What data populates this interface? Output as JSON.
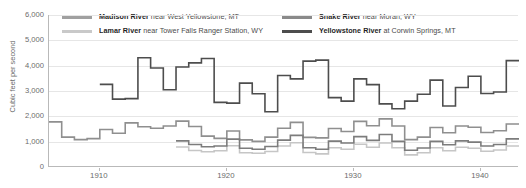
{
  "chart_data": {
    "type": "line",
    "title": "",
    "subtitle": "",
    "xlabel": "",
    "ylabel": "Cubic feet per second",
    "xlim": [
      1906,
      1943
    ],
    "ylim": [
      0,
      6000
    ],
    "grid": true,
    "legend_position": "top",
    "step": "pre",
    "yticks": [
      0,
      1000,
      2000,
      3000,
      4000,
      5000,
      6000
    ],
    "ytick_labels": [
      "0",
      "1,000",
      "2,000",
      "3,000",
      "4,000",
      "5,000",
      "6,000"
    ],
    "xticks": [
      1910,
      1920,
      1930,
      1940
    ],
    "xtick_labels": [
      "1910",
      "1920",
      "1930",
      "1940"
    ],
    "x": [
      1906,
      1907,
      1908,
      1909,
      1910,
      1911,
      1912,
      1913,
      1914,
      1915,
      1916,
      1917,
      1918,
      1919,
      1920,
      1921,
      1922,
      1923,
      1924,
      1925,
      1926,
      1927,
      1928,
      1929,
      1930,
      1931,
      1932,
      1933,
      1934,
      1935,
      1936,
      1937,
      1938,
      1939,
      1940,
      1941,
      1942
    ],
    "series": [
      {
        "name": "Madison River",
        "location": "near West Yellowstone, MT",
        "color": "#8f8f8f",
        "values": [
          1780,
          1180,
          1080,
          1120,
          1480,
          1330,
          1740,
          1590,
          1530,
          1620,
          1810,
          1600,
          1220,
          1130,
          1420,
          1070,
          1010,
          1180,
          1530,
          1760,
          1170,
          1150,
          1520,
          1400,
          1800,
          1630,
          1900,
          1620,
          1080,
          1180,
          1560,
          1350,
          1620,
          1570,
          1360,
          1430,
          1700
        ]
      },
      {
        "name": "Lamar River",
        "location": "near Tower Falls Ranger Station, WY",
        "color": "#c6c6c6",
        "values": [
          null,
          null,
          null,
          null,
          null,
          null,
          null,
          null,
          null,
          null,
          790,
          650,
          600,
          640,
          840,
          560,
          540,
          610,
          830,
          960,
          570,
          520,
          760,
          700,
          900,
          780,
          950,
          760,
          480,
          560,
          760,
          640,
          780,
          740,
          620,
          670,
          830
        ]
      },
      {
        "name": "Snake River",
        "location": "near Moran, WY",
        "color": "#7c7c7c",
        "values": [
          null,
          null,
          null,
          null,
          null,
          null,
          null,
          null,
          null,
          null,
          1030,
          890,
          800,
          830,
          1100,
          740,
          700,
          810,
          1060,
          1250,
          760,
          700,
          1020,
          950,
          1200,
          1050,
          1280,
          1010,
          660,
          750,
          1010,
          880,
          1030,
          980,
          830,
          890,
          1110
        ]
      },
      {
        "name": "Yellowstone River",
        "location": "at Corwin Springs, MT",
        "color": "#4d4d4d",
        "values": [
          null,
          null,
          null,
          null,
          3260,
          2680,
          2700,
          4310,
          3910,
          3050,
          3950,
          4110,
          4280,
          2550,
          2520,
          3310,
          2890,
          2180,
          3610,
          3480,
          4180,
          4220,
          2740,
          2600,
          3480,
          3250,
          2490,
          2300,
          2600,
          2870,
          3430,
          2410,
          3140,
          3580,
          2900,
          2960,
          4200
        ]
      }
    ]
  },
  "legend": {
    "entries": [
      {
        "name": "Madison River",
        "location": " near West Yellowstone, MT",
        "color": "#a0a0a0"
      },
      {
        "name": "Lamar River",
        "location": " near Tower Falls Ranger Station, WY",
        "color": "#c9c9c9"
      },
      {
        "name": "Snake River",
        "location": " near Moran, WY",
        "color": "#8a8a8a"
      },
      {
        "name": "Yellowstone River",
        "location": " at Corwin Springs, MT",
        "color": "#4d4d4d"
      }
    ]
  },
  "axes": {
    "y_title": "Cubic feet per second",
    "y_labels": [
      "6,000",
      "5,000",
      "4,000",
      "3,000",
      "2,000",
      "1,000",
      "0"
    ],
    "x_labels": [
      "1910",
      "1920",
      "1930",
      "1940"
    ]
  }
}
